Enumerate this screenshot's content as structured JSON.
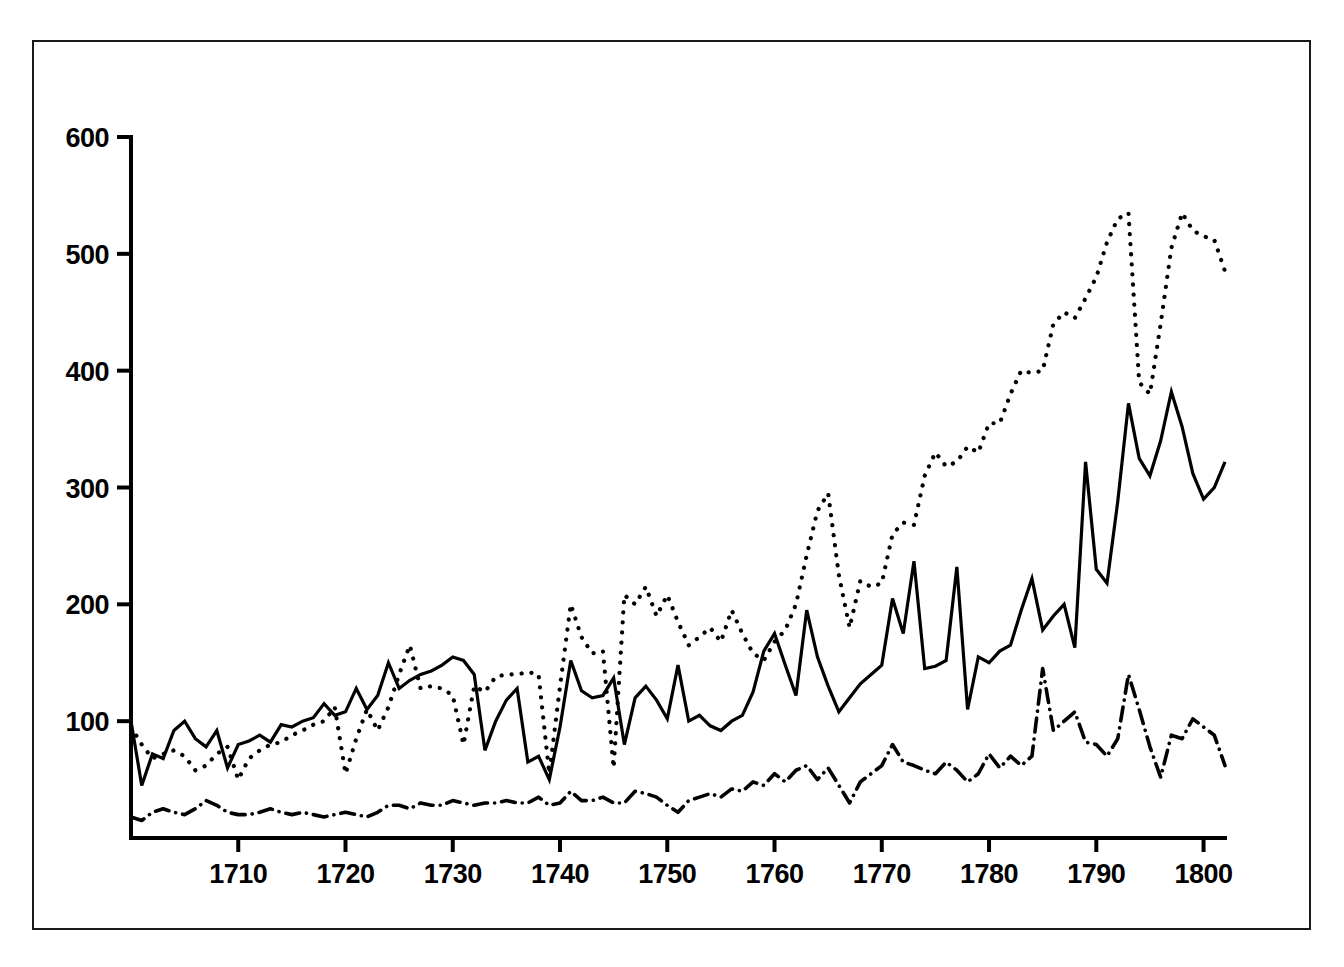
{
  "figure": {
    "title": "",
    "background_color": "#ffffff",
    "line_color": "#000000",
    "frame": {
      "border": true
    }
  },
  "axes": {
    "y_ticks": [
      100,
      200,
      300,
      400,
      500,
      600
    ],
    "y_tick_labels": [
      "100",
      "200",
      "300",
      "400",
      "500",
      "600"
    ],
    "x_ticks": [
      1710,
      1720,
      1730,
      1740,
      1750,
      1760,
      1770,
      1780,
      1790,
      1800
    ],
    "x_tick_labels": [
      "1710",
      "1720",
      "1730",
      "1740",
      "1750",
      "1760",
      "1770",
      "1780",
      "1790",
      "1800"
    ],
    "xlim": [
      1700,
      1802
    ],
    "ylim": [
      0,
      600
    ],
    "grid": false
  },
  "chart_data": {
    "type": "line",
    "title": "",
    "subtitle": "",
    "xlabel": "",
    "ylabel": "",
    "xlim": [
      1700,
      1802
    ],
    "ylim": [
      0,
      600
    ],
    "grid": false,
    "legend": "none",
    "x": [
      1700,
      1701,
      1702,
      1703,
      1704,
      1705,
      1706,
      1707,
      1708,
      1709,
      1710,
      1711,
      1712,
      1713,
      1714,
      1715,
      1716,
      1717,
      1718,
      1719,
      1720,
      1721,
      1722,
      1723,
      1724,
      1725,
      1726,
      1727,
      1728,
      1729,
      1730,
      1731,
      1732,
      1733,
      1734,
      1735,
      1736,
      1737,
      1738,
      1739,
      1740,
      1741,
      1742,
      1743,
      1744,
      1745,
      1746,
      1747,
      1748,
      1749,
      1750,
      1751,
      1752,
      1753,
      1754,
      1755,
      1756,
      1757,
      1758,
      1759,
      1760,
      1761,
      1762,
      1763,
      1764,
      1765,
      1766,
      1767,
      1768,
      1769,
      1770,
      1771,
      1772,
      1773,
      1774,
      1775,
      1776,
      1777,
      1778,
      1779,
      1780,
      1781,
      1782,
      1783,
      1784,
      1785,
      1786,
      1787,
      1788,
      1789,
      1790,
      1791,
      1792,
      1793,
      1794,
      1795,
      1796,
      1797,
      1798,
      1799,
      1800,
      1801,
      1802
    ],
    "series": [
      {
        "name": "solid-series",
        "style": "solid",
        "color": "#000000",
        "values": [
          100,
          45,
          72,
          68,
          92,
          100,
          85,
          78,
          92,
          60,
          80,
          83,
          88,
          82,
          97,
          95,
          100,
          103,
          115,
          105,
          108,
          128,
          110,
          122,
          150,
          128,
          135,
          140,
          143,
          148,
          155,
          152,
          140,
          75,
          100,
          118,
          128,
          65,
          70,
          50,
          95,
          152,
          126,
          120,
          122,
          137,
          80,
          120,
          130,
          118,
          102,
          148,
          100,
          105,
          96,
          92,
          100,
          105,
          125,
          160,
          175,
          148,
          122,
          195,
          155,
          130,
          108,
          120,
          132,
          140,
          148,
          205,
          175,
          237,
          145,
          147,
          152,
          232,
          110,
          155,
          150,
          160,
          165,
          195,
          222,
          178,
          190,
          200,
          163,
          322,
          230,
          218,
          288,
          372,
          325,
          310,
          340,
          382,
          352,
          312,
          290,
          300,
          322
        ]
      },
      {
        "name": "dotted-series",
        "style": "dotted",
        "color": "#000000",
        "values": [
          95,
          80,
          68,
          72,
          75,
          70,
          58,
          62,
          72,
          78,
          50,
          68,
          75,
          80,
          82,
          88,
          92,
          97,
          100,
          112,
          55,
          85,
          110,
          92,
          112,
          140,
          165,
          128,
          130,
          128,
          122,
          80,
          130,
          125,
          138,
          140,
          140,
          142,
          140,
          55,
          130,
          200,
          172,
          158,
          160,
          60,
          208,
          200,
          215,
          190,
          208,
          185,
          165,
          172,
          180,
          168,
          195,
          175,
          158,
          152,
          168,
          178,
          200,
          242,
          280,
          295,
          225,
          180,
          220,
          215,
          218,
          260,
          270,
          268,
          310,
          330,
          318,
          322,
          335,
          330,
          355,
          355,
          380,
          400,
          398,
          400,
          440,
          450,
          445,
          462,
          480,
          510,
          530,
          535,
          390,
          380,
          440,
          505,
          535,
          520,
          515,
          512,
          485
        ]
      },
      {
        "name": "dashdot-series",
        "style": "dashdot",
        "color": "#000000",
        "values": [
          18,
          15,
          22,
          25,
          22,
          20,
          25,
          32,
          28,
          22,
          20,
          20,
          22,
          25,
          22,
          20,
          22,
          20,
          18,
          20,
          22,
          20,
          18,
          22,
          28,
          28,
          25,
          30,
          28,
          28,
          32,
          30,
          28,
          30,
          30,
          32,
          30,
          30,
          35,
          28,
          30,
          40,
          32,
          32,
          35,
          30,
          30,
          40,
          38,
          35,
          28,
          22,
          32,
          35,
          38,
          35,
          42,
          40,
          48,
          45,
          55,
          48,
          58,
          62,
          50,
          60,
          45,
          30,
          48,
          55,
          62,
          80,
          65,
          62,
          58,
          55,
          65,
          58,
          48,
          55,
          72,
          60,
          70,
          62,
          70,
          145,
          92,
          100,
          108,
          82,
          80,
          70,
          85,
          140,
          110,
          78,
          52,
          88,
          85,
          102,
          95,
          88,
          62
        ]
      }
    ]
  }
}
